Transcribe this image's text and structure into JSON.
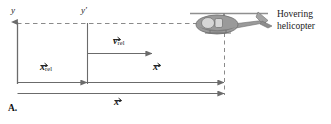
{
  "figure": {
    "panel_label": "A.",
    "callout": {
      "line1": "Hovering",
      "line2": "helicopter"
    },
    "axes": [
      {
        "name": "y-axis",
        "label": "y",
        "x": 17,
        "label_x": 12,
        "label_y": 8
      },
      {
        "name": "yprime-axis",
        "label": "y′",
        "x": 87,
        "label_x": 82,
        "label_y": 8
      }
    ],
    "vectors": [
      {
        "name": "v-rel",
        "symbol": "v",
        "sub": "rel",
        "prime": "",
        "label_x": 118,
        "label_y": 38
      },
      {
        "name": "x-rel",
        "symbol": "x",
        "sub": "rel",
        "prime": "",
        "label_x": 42,
        "label_y": 64
      },
      {
        "name": "x-prime",
        "symbol": "x",
        "sub": "",
        "prime": "′",
        "label_x": 155,
        "label_y": 64
      },
      {
        "name": "x-total",
        "symbol": "x",
        "sub": "",
        "prime": "",
        "label_x": 116,
        "label_y": 99
      }
    ],
    "icons": {
      "helicopter": "helicopter-icon"
    },
    "colors": {
      "line": "#6b6b6b",
      "dashed": "#8a8a8a",
      "text": "#1a1a1a",
      "helicopter_body": "#9a9a9a",
      "helicopter_dark": "#6e6e6e",
      "helicopter_window": "#d6d6d6"
    }
  }
}
